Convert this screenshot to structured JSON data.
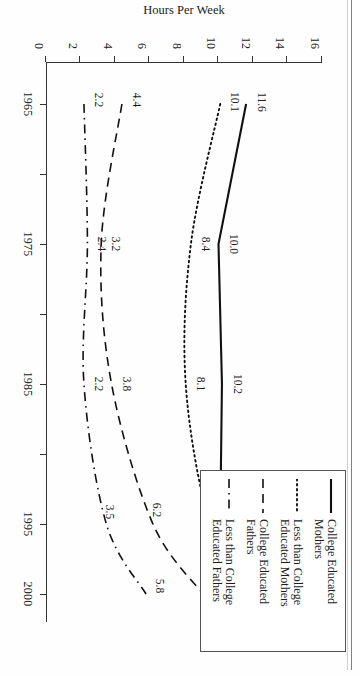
{
  "chart_data": {
    "type": "line",
    "title": "",
    "xlabel": "",
    "ylabel": "Hours Per Week",
    "x": [
      1965,
      1975,
      1985,
      1995,
      2000
    ],
    "xlim": [
      1962,
      2002
    ],
    "ylim": [
      0,
      16
    ],
    "x_tick_labels": [
      "1965",
      "1975",
      "1985",
      "1995",
      "2000"
    ],
    "x_minor_ticks": [
      1970,
      1980,
      1990
    ],
    "y_tick_labels": [
      "0",
      "2",
      "4",
      "6",
      "8",
      "10",
      "12",
      "14",
      "16"
    ],
    "y_ticks": [
      0,
      2,
      4,
      6,
      8,
      10,
      12,
      14,
      16
    ],
    "grid": false,
    "legend_position": "top-right",
    "series": [
      {
        "name": "College Educated Mothers",
        "style": "solid",
        "values": [
          11.6,
          10.0,
          10.2,
          10.1,
          13.8
        ],
        "labels": [
          "11.6",
          "10.0",
          "10.2",
          "10.1",
          "13.8"
        ]
      },
      {
        "name": "Less than College Educated Mothers",
        "style": "dotted",
        "values": [
          10.1,
          8.4,
          8.1,
          9.5,
          11.8
        ],
        "labels": [
          "10.1",
          "8.4",
          "8.1",
          "9.5",
          "11.8"
        ]
      },
      {
        "name": "College Educated Fathers",
        "style": "dashed",
        "values": [
          4.4,
          3.2,
          3.8,
          6.2,
          9.1
        ],
        "labels": [
          "4.4",
          "3.2",
          "3.8",
          "6.2",
          "9.1"
        ]
      },
      {
        "name": "Less than College Educated Fathers",
        "style": "dashdot",
        "values": [
          2.2,
          2.4,
          2.2,
          3.5,
          5.8
        ],
        "labels": [
          "2.2",
          "2.4",
          "2.2",
          "3.5",
          "5.8"
        ]
      }
    ]
  },
  "axis": {
    "y_title": "Hours Per Week"
  },
  "legend": {
    "items": [
      {
        "label": "College Educated\nMothers",
        "style": "solid"
      },
      {
        "label": "Less than College\nEducated Mothers",
        "style": "dotted"
      },
      {
        "label": "College Educated\nFathers",
        "style": "dashed"
      },
      {
        "label": "Less than College\nEducated Fathers",
        "style": "dashdot"
      }
    ]
  }
}
